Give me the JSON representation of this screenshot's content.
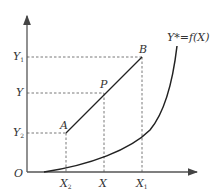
{
  "diagram": {
    "axes": {
      "origin_label": "O"
    },
    "y_ticks": [
      {
        "id": "y1",
        "label": "Y",
        "sub": "1"
      },
      {
        "id": "y",
        "label": "Y",
        "sub": ""
      },
      {
        "id": "y2",
        "label": "Y",
        "sub": "2"
      }
    ],
    "x_ticks": [
      {
        "id": "x2",
        "label": "X",
        "sub": "2"
      },
      {
        "id": "x",
        "label": "X",
        "sub": ""
      },
      {
        "id": "x1",
        "label": "X",
        "sub": "1"
      }
    ],
    "points": [
      {
        "id": "A",
        "label": "A"
      },
      {
        "id": "P",
        "label": "P"
      },
      {
        "id": "B",
        "label": "B"
      }
    ],
    "curve_label": "Y*=f(X)"
  }
}
